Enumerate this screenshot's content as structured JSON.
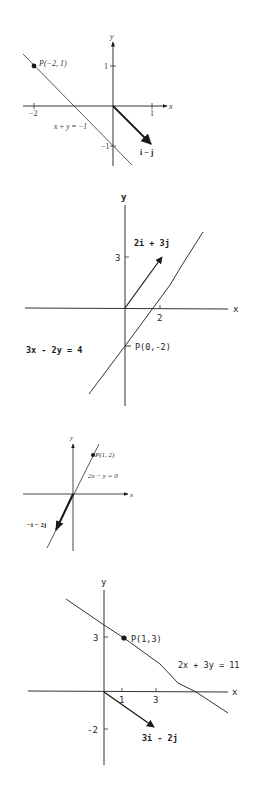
{
  "figures": [
    {
      "id": "fig1",
      "axis_labels": {
        "x": "x",
        "y": "y"
      },
      "ticks": {
        "x_neg": "−2",
        "x_pos": "1",
        "y_pos": "1",
        "y_neg": "−1"
      },
      "point": {
        "label": "P(−2, 1)",
        "x": -2,
        "y": 1
      },
      "line": {
        "equation": "x + y = −1"
      },
      "vector": {
        "label": "i − j",
        "components": [
          1,
          -1
        ]
      }
    },
    {
      "id": "fig2",
      "axis_labels": {
        "x": "x",
        "y": "y"
      },
      "ticks": {
        "y_pos": "3",
        "x_pos": "2"
      },
      "point": {
        "label": "P(0,-2)",
        "x": 0,
        "y": -2
      },
      "line": {
        "equation": "3x - 2y = 4"
      },
      "vector": {
        "label": "2i + 3j",
        "components": [
          2,
          3
        ]
      }
    },
    {
      "id": "fig3",
      "axis_labels": {
        "x": "x",
        "y": "y"
      },
      "point": {
        "label": "P(1, 2)",
        "x": 1,
        "y": 2
      },
      "line": {
        "equation": "2x − y = 0"
      },
      "vector": {
        "label": "−i − 2j",
        "components": [
          -1,
          -2
        ]
      }
    },
    {
      "id": "fig4",
      "axis_labels": {
        "x": "x",
        "y": "y"
      },
      "ticks": {
        "y_pos": "3",
        "y_neg": "-2",
        "x_1": "1",
        "x_3": "3"
      },
      "point": {
        "label": "P(1,3)",
        "x": 1,
        "y": 3
      },
      "line": {
        "equation": "2x + 3y = 11"
      },
      "vector": {
        "label": "3i - 2j",
        "components": [
          3,
          -2
        ]
      }
    }
  ],
  "colors": {
    "ink": "#1a1a1a",
    "background": "#ffffff"
  }
}
